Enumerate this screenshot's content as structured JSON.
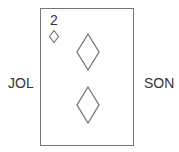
{
  "labels": {
    "left": "JOL",
    "right": "SON"
  },
  "card": {
    "rank": "2",
    "suit": "diamond",
    "suit_icon": "diamond-outline-icon",
    "pip_count": 2,
    "border_color": "#777777",
    "pip_stroke_color": "#777777"
  }
}
